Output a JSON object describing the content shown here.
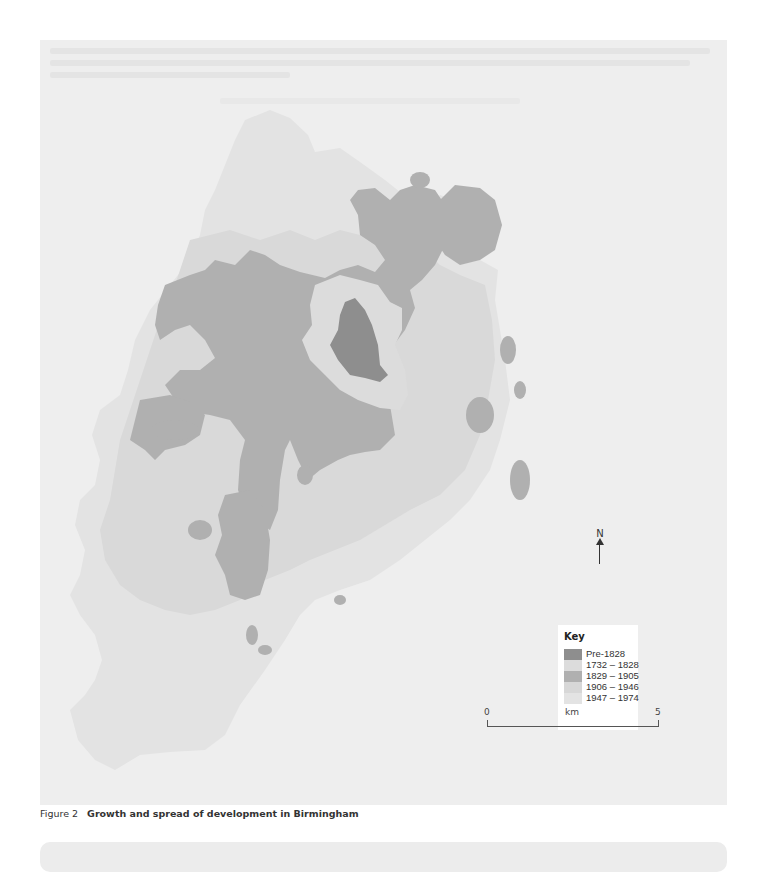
{
  "figure": {
    "number": "Figure 2",
    "title": "Growth and spread of development in Birmingham"
  },
  "map": {
    "background_color": "#eeeeee",
    "north_label": "N",
    "key": {
      "title": "Key",
      "items": [
        {
          "label": "Pre-1828",
          "color": "#8e8e8e"
        },
        {
          "label": "1732 – 1828",
          "color": "#dcdcdc"
        },
        {
          "label": "1829 – 1905",
          "color": "#b0b0b0"
        },
        {
          "label": "1906 – 1946",
          "color": "#d7d7d7"
        },
        {
          "label": "1947 – 1974",
          "color": "#e3e3e3"
        }
      ]
    },
    "scale_bar": {
      "start": "0",
      "unit": "km",
      "end": "5"
    }
  }
}
